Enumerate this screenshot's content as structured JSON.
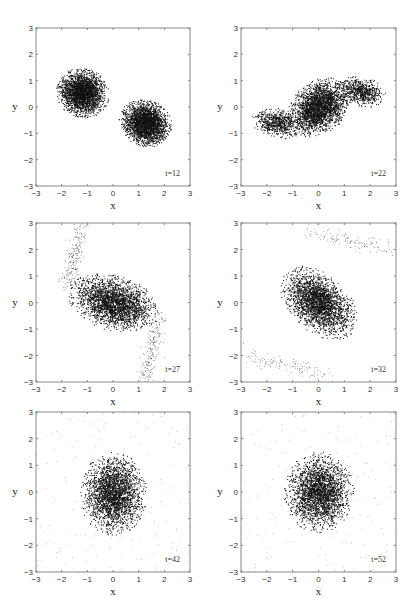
{
  "figure": {
    "layout": "3 rows x 2 columns of scatter panels",
    "ink_color": "#111111",
    "frame_color": "#888888"
  },
  "chart_data": [
    {
      "type": "scatter",
      "title": "",
      "annotation": "t=12",
      "xlabel": "x",
      "ylabel": "y",
      "xlim": [
        -3,
        3
      ],
      "ylim": [
        -3,
        3
      ],
      "xticks": [
        -3,
        -2,
        -1,
        0,
        1,
        2,
        3
      ],
      "yticks": [
        -3,
        -2,
        -1,
        0,
        1,
        2,
        3
      ],
      "grid": false,
      "description": "Two separate elliptical particle clouds",
      "clusters": [
        {
          "cx": -1.2,
          "cy": 0.55,
          "rx": 1.0,
          "ry": 0.9,
          "angle": -20,
          "density": "dense"
        },
        {
          "cx": 1.25,
          "cy": -0.6,
          "rx": 1.0,
          "ry": 0.85,
          "angle": -20,
          "density": "dense"
        }
      ]
    },
    {
      "type": "scatter",
      "title": "",
      "annotation": "t=22",
      "xlabel": "x",
      "ylabel": "y",
      "xlim": [
        -3,
        3
      ],
      "ylim": [
        -3,
        3
      ],
      "xticks": [
        -3,
        -2,
        -1,
        0,
        1,
        2,
        3
      ],
      "yticks": [
        -3,
        -2,
        -1,
        0,
        1,
        2,
        3
      ],
      "grid": false,
      "description": "Clouds merging into an S-shaped structure spanning x from about -2.7 to 2.6",
      "clusters": [
        {
          "cx": 0.0,
          "cy": 0.0,
          "rx": 1.3,
          "ry": 0.95,
          "angle": 35,
          "density": "dense"
        },
        {
          "cx": -1.6,
          "cy": -0.6,
          "rx": 1.0,
          "ry": 0.55,
          "angle": -10,
          "density": "medium"
        },
        {
          "cx": 1.6,
          "cy": 0.6,
          "rx": 1.0,
          "ry": 0.55,
          "angle": -10,
          "density": "medium"
        }
      ]
    },
    {
      "type": "scatter",
      "title": "",
      "annotation": "t=27",
      "xlabel": "x",
      "ylabel": "y",
      "xlim": [
        -3,
        3
      ],
      "ylim": [
        -3,
        3
      ],
      "xticks": [
        -3,
        -2,
        -1,
        0,
        1,
        2,
        3
      ],
      "yticks": [
        -3,
        -2,
        -1,
        0,
        1,
        2,
        3
      ],
      "grid": false,
      "description": "Single merged ellipse with two spiral tidal arms",
      "clusters": [
        {
          "cx": 0.0,
          "cy": 0.0,
          "rx": 1.75,
          "ry": 1.0,
          "angle": -15,
          "density": "dense"
        }
      ],
      "arms": [
        {
          "from": [
            -1.8,
            0.6
          ],
          "to": [
            -1.2,
            3.0
          ],
          "density": "sparse"
        },
        {
          "from": [
            1.8,
            -0.6
          ],
          "to": [
            1.2,
            -3.0
          ],
          "density": "sparse"
        }
      ]
    },
    {
      "type": "scatter",
      "title": "",
      "annotation": "t=32",
      "xlabel": "x",
      "ylabel": "y",
      "xlim": [
        -3,
        3
      ],
      "ylim": [
        -3,
        3
      ],
      "xticks": [
        -3,
        -2,
        -1,
        0,
        1,
        2,
        3
      ],
      "yticks": [
        -3,
        -2,
        -1,
        0,
        1,
        2,
        3
      ],
      "grid": false,
      "description": "Tilted ellipse with faint diffuse arcs near top and bottom",
      "clusters": [
        {
          "cx": 0.0,
          "cy": 0.0,
          "rx": 1.65,
          "ry": 1.05,
          "angle": -40,
          "density": "dense"
        }
      ],
      "arms": [
        {
          "from": [
            -0.5,
            2.7
          ],
          "to": [
            2.8,
            2.0
          ],
          "density": "very sparse"
        },
        {
          "from": [
            -2.8,
            -2.0
          ],
          "to": [
            0.5,
            -2.7
          ],
          "density": "very sparse"
        }
      ]
    },
    {
      "type": "scatter",
      "title": "",
      "annotation": "t=42",
      "xlabel": "x",
      "ylabel": "y",
      "xlim": [
        -3,
        3
      ],
      "ylim": [
        -3,
        3
      ],
      "xticks": [
        -3,
        -2,
        -1,
        0,
        1,
        2,
        3
      ],
      "yticks": [
        -3,
        -2,
        -1,
        0,
        1,
        2,
        3
      ],
      "grid": false,
      "description": "Nearly round core with sparse outer halo",
      "clusters": [
        {
          "cx": 0.0,
          "cy": -0.05,
          "rx": 1.25,
          "ry": 1.5,
          "angle": 0,
          "density": "dense"
        }
      ]
    },
    {
      "type": "scatter",
      "title": "",
      "annotation": "t=52",
      "xlabel": "x",
      "ylabel": "y",
      "xlim": [
        -3,
        3
      ],
      "ylim": [
        -3,
        3
      ],
      "xticks": [
        -3,
        -2,
        -1,
        0,
        1,
        2,
        3
      ],
      "yticks": [
        -3,
        -2,
        -1,
        0,
        1,
        2,
        3
      ],
      "grid": false,
      "description": "Relaxed round core with diffuse halo across the full domain",
      "clusters": [
        {
          "cx": 0.0,
          "cy": 0.0,
          "rx": 1.3,
          "ry": 1.45,
          "angle": 0,
          "density": "dense"
        }
      ]
    }
  ],
  "panels": [
    {
      "annotation": "t=12",
      "xlabel": "x",
      "ylabel": "y"
    },
    {
      "annotation": "t=22",
      "xlabel": "x",
      "ylabel": "y"
    },
    {
      "annotation": "t=27",
      "xlabel": "x",
      "ylabel": "y"
    },
    {
      "annotation": "t=32",
      "xlabel": "x",
      "ylabel": "y"
    },
    {
      "annotation": "t=42",
      "xlabel": "x",
      "ylabel": "y"
    },
    {
      "annotation": "t=52",
      "xlabel": "x",
      "ylabel": "y"
    }
  ]
}
